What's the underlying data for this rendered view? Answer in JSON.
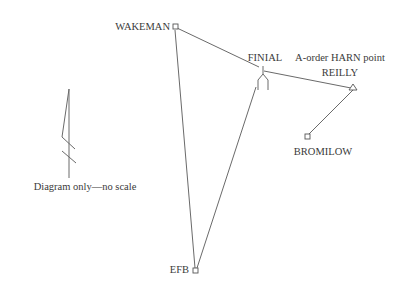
{
  "stations": {
    "wakeman": {
      "label": "WAKEMAN",
      "symbol": "square"
    },
    "finial": {
      "label": "FINIAL",
      "symbol": "finial"
    },
    "reilly": {
      "label": "REILLY",
      "sublabel": "A-order HARN point",
      "symbol": "triangle"
    },
    "bromilow": {
      "label": "BROMILOW",
      "symbol": "square"
    },
    "efb": {
      "label": "EFB",
      "symbol": "square"
    }
  },
  "connections": [
    [
      "wakeman",
      "finial"
    ],
    [
      "wakeman",
      "efb"
    ],
    [
      "efb",
      "finial"
    ],
    [
      "finial",
      "reilly"
    ],
    [
      "reilly",
      "bromilow"
    ]
  ],
  "north_arrow": {
    "note": "Diagram only—no scale"
  }
}
